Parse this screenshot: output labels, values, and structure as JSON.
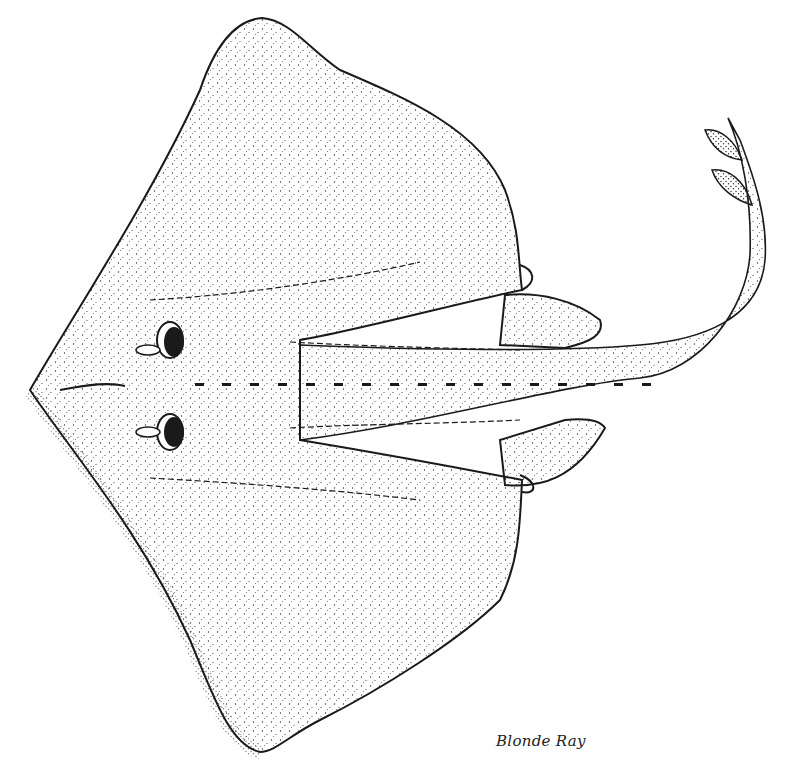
{
  "figure": {
    "subject": "Blonde Ray",
    "caption": "Blonde Ray",
    "style": "stippled pen-and-ink illustration",
    "ink_color": "#1a1a1a",
    "paper_color": "#ffffff"
  }
}
